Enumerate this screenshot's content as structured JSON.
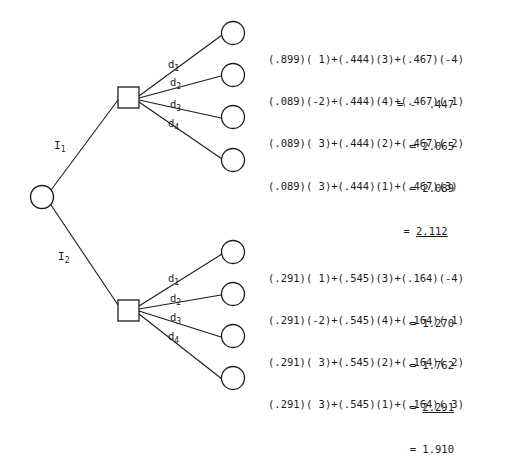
{
  "diagram": {
    "root_node": {
      "shape": "circle",
      "label": ""
    },
    "information_branches": [
      {
        "name": "I-1",
        "label": "I",
        "sub": "1"
      },
      {
        "name": "I-2",
        "label": "I",
        "sub": "2"
      }
    ],
    "decision_labels": [
      {
        "label": "d",
        "sub": "1"
      },
      {
        "label": "d",
        "sub": "2"
      },
      {
        "label": "d",
        "sub": "3"
      },
      {
        "label": "d",
        "sub": "4"
      }
    ],
    "colors": {
      "ink": "#1c1c1c",
      "background": "#ffffff"
    }
  },
  "branches": [
    {
      "branch": "I1",
      "probabilities": [
        ".899",
        ".444",
        ".467"
      ],
      "outcomes": [
        {
          "decision": "d1",
          "expression": "(.899)( 1)+(.444)(3)+(.467)(-4)",
          "equals": "=",
          "value": "-  .447",
          "numeric": -0.447,
          "optimal": false
        },
        {
          "decision": "d2",
          "expression": "(.089)(-2)+(.444)(4)+(.467)( 1)",
          "equals": "=",
          "value": "2.065",
          "numeric": 2.065,
          "optimal": false
        },
        {
          "decision": "d3",
          "expression": "(.089)( 3)+(.444)(2)+(.467)( 2)",
          "equals": "=",
          "value": "2.089",
          "numeric": 2.089,
          "optimal": false
        },
        {
          "decision": "d4",
          "expression": "(.089)( 3)+(.444)(1)+(.467)(3)",
          "equals": "=",
          "value": "2.112",
          "numeric": 2.112,
          "optimal": true
        }
      ]
    },
    {
      "branch": "I2",
      "probabilities": [
        ".291",
        ".545",
        ".164"
      ],
      "outcomes": [
        {
          "decision": "d1",
          "expression": "(.291)( 1)+(.545)(3)+(.164)(-4)",
          "equals": "=",
          "value": "1.270",
          "numeric": 1.27,
          "optimal": false
        },
        {
          "decision": "d2",
          "expression": "(.291)(-2)+(.545)(4)+(.164)( 1)",
          "equals": "=",
          "value": "1.762",
          "numeric": 1.762,
          "optimal": false
        },
        {
          "decision": "d3",
          "expression": "(.291)( 3)+(.545)(2)+(.164)( 2)",
          "equals": "=",
          "value": "2.291",
          "numeric": 2.291,
          "optimal": true
        },
        {
          "decision": "d4",
          "expression": "(.291)( 3)+(.545)(1)+(.164)( 3)",
          "equals": "=",
          "value": "1.910",
          "numeric": 1.91,
          "optimal": false
        }
      ]
    }
  ]
}
